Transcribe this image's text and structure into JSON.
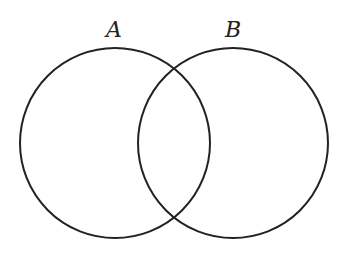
{
  "diagram": {
    "type": "venn",
    "stroke_color": "#222222",
    "background": "#ffffff",
    "sets": [
      {
        "label": "A",
        "cx": 115,
        "cy": 143,
        "r": 95,
        "label_x": 114,
        "label_y": 37
      },
      {
        "label": "B",
        "cx": 233,
        "cy": 143,
        "r": 95,
        "label_x": 233,
        "label_y": 37
      }
    ]
  }
}
